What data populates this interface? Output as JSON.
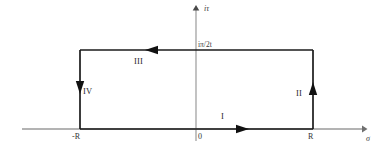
{
  "figure": {
    "background_color": "#ffffff",
    "axis_color": "#8a8a8a",
    "contour_color": "#1a1a1a",
    "text_color": "#2b2b2b"
  },
  "axes": {
    "x_axis": {
      "name": "horizontal-axis",
      "label": "σ",
      "label_x": 368,
      "label_y": 140,
      "y_position": 129,
      "x_start": 22,
      "x_end": 366
    },
    "y_axis": {
      "name": "vertical-axis",
      "label": "iτ",
      "label_x": 204,
      "label_y": 8,
      "x_position": 196,
      "y_start": 7,
      "y_end": 141
    }
  },
  "ticks": [
    {
      "label": "-R",
      "x": 75,
      "y": 136,
      "axis": "x"
    },
    {
      "label": "0",
      "x": 199,
      "y": 136,
      "axis": "x"
    },
    {
      "label": "R",
      "x": 309,
      "y": 136,
      "axis": "x"
    },
    {
      "label": "iπ/2t",
      "x": 198,
      "y": 43,
      "axis": "y"
    }
  ],
  "contour": {
    "name": "rectangular-contour",
    "left": 80,
    "right": 313,
    "top": 50,
    "bottom": 129,
    "segments": [
      {
        "id": "I",
        "label": "I",
        "description": "bottom edge, rightward",
        "direction": "right",
        "label_x": 222,
        "label_y": 117,
        "arrow_x": 243,
        "arrow_y": 129
      },
      {
        "id": "II",
        "label": "II",
        "description": "right edge, upward",
        "direction": "up",
        "label_x": 297,
        "label_y": 93,
        "arrow_x": 313,
        "arrow_y": 89
      },
      {
        "id": "III",
        "label": "III",
        "description": "top edge, leftward",
        "direction": "left",
        "label_x": 136,
        "label_y": 61,
        "arrow_x": 152,
        "arrow_y": 50
      },
      {
        "id": "IV",
        "label": "IV",
        "description": "left edge, downward",
        "direction": "down",
        "label_x": 84,
        "label_y": 91,
        "arrow_x": 80,
        "arrow_y": 87
      }
    ]
  }
}
